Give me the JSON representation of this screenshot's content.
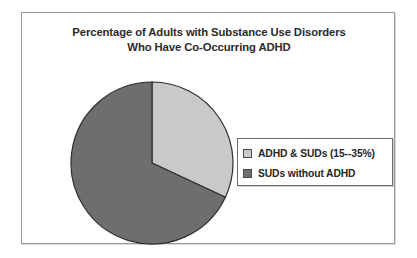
{
  "chart_data": {
    "type": "pie",
    "title": "Percentage of Adults with Substance Use Disorders Who Have Co-Occurring ADHD",
    "title_lines": [
      "Percentage of Adults with Substance Use Disorders",
      "Who Have Co-Occurring ADHD"
    ],
    "categories": [
      "ADHD  &  SUDs  (15--35%)",
      "SUDs  without ADHD"
    ],
    "values": [
      32,
      68
    ],
    "slices": [
      {
        "label": "ADHD  &  SUDs  (15--35%)",
        "value": 32,
        "start_angle_deg": 0,
        "end_angle_deg": 115,
        "color": "#c9c9c9",
        "swatch_color": "#c9c9c9"
      },
      {
        "label": "SUDs  without ADHD",
        "value": 68,
        "start_angle_deg": 115,
        "end_angle_deg": 360,
        "color": "#6e6e6e",
        "swatch_color": "#6e6e6e"
      }
    ],
    "xlabel": "",
    "ylabel": "",
    "legend_position": "right",
    "grid": false,
    "start_angle": "12-oclock",
    "direction": "clockwise",
    "slice_border_color": "#2f2f2f",
    "frame_border_color": "#9a9a9a",
    "background_color": "#ffffff"
  },
  "legend": {
    "items": [
      {
        "label": "ADHD  &  SUDs  (15--35%)",
        "color": "#c9c9c9"
      },
      {
        "label": "SUDs  without ADHD",
        "color": "#6e6e6e"
      }
    ]
  }
}
